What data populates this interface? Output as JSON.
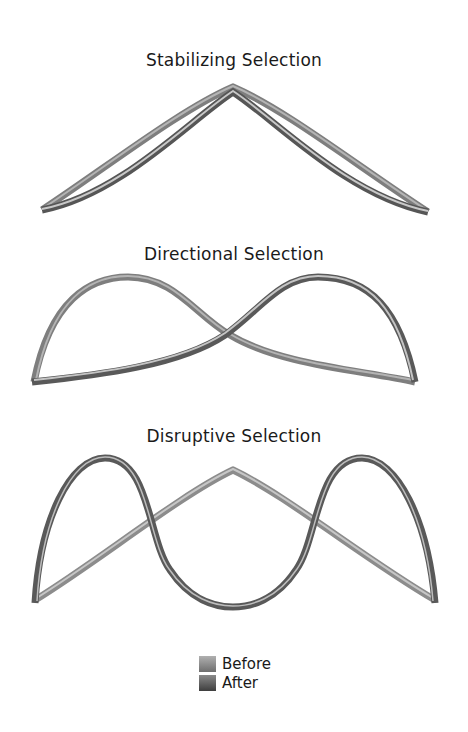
{
  "panels": [
    {
      "title": "Stabilizing Selection"
    },
    {
      "title": "Directional Selection"
    },
    {
      "title": "Disruptive Selection"
    }
  ],
  "legend": {
    "items": [
      {
        "label": "Before",
        "color": "#8a8a8a"
      },
      {
        "label": "After",
        "color": "#595959"
      }
    ]
  },
  "colors": {
    "before_tube": "#8c8c8c",
    "after_tube": "#5a5a5a",
    "highlight": "#dcdcdc"
  }
}
